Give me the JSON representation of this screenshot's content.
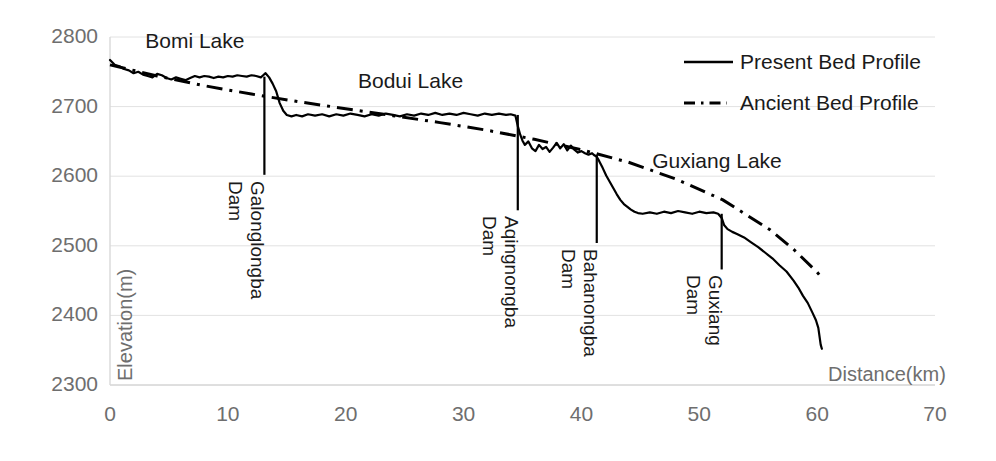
{
  "chart_data": {
    "type": "line",
    "title": "",
    "xlabel": "Distance(km)",
    "ylabel": "Elevation(m)",
    "xlim": [
      0,
      70
    ],
    "ylim": [
      2300,
      2800
    ],
    "xticks": [
      "0",
      "10",
      "20",
      "30",
      "40",
      "50",
      "60",
      "70"
    ],
    "xtick_values": [
      0,
      10,
      20,
      30,
      40,
      50,
      60,
      70
    ],
    "yticks": [
      "2300",
      "2400",
      "2500",
      "2600",
      "2700",
      "2800"
    ],
    "ytick_values": [
      2300,
      2400,
      2500,
      2600,
      2700,
      2800
    ],
    "grid": "horizontal-light",
    "legend_position": "top-right",
    "series": [
      {
        "name": "Present Bed Profile",
        "style": "solid",
        "color": "#000000",
        "x": [
          0.0,
          0.4,
          0.8,
          1.2,
          1.6,
          2.0,
          2.4,
          2.8,
          3.2,
          3.6,
          4.0,
          4.4,
          4.8,
          5.2,
          5.6,
          6.0,
          6.4,
          6.8,
          7.2,
          7.6,
          8.0,
          8.4,
          8.8,
          9.2,
          9.6,
          10.0,
          10.4,
          10.8,
          11.2,
          11.6,
          12.0,
          12.4,
          12.8,
          13.0,
          13.2,
          13.5,
          13.8,
          14.1,
          14.4,
          14.7,
          15.0,
          15.4,
          15.8,
          16.3,
          16.8,
          17.4,
          18.0,
          18.6,
          19.2,
          19.8,
          20.4,
          21.0,
          21.6,
          22.2,
          22.8,
          23.4,
          24.0,
          24.6,
          25.2,
          25.8,
          26.4,
          27.0,
          27.6,
          28.2,
          28.8,
          29.4,
          30.0,
          30.6,
          31.2,
          31.8,
          32.4,
          33.0,
          33.6,
          34.0,
          34.4,
          34.6,
          34.8,
          35.0,
          35.2,
          35.5,
          35.8,
          36.1,
          36.4,
          36.7,
          37.0,
          37.3,
          37.6,
          37.9,
          38.2,
          38.5,
          38.8,
          39.1,
          39.4,
          39.7,
          40.0,
          40.3,
          40.6,
          40.9,
          41.1,
          41.3,
          41.5,
          41.8,
          42.1,
          42.4,
          42.7,
          43.0,
          43.3,
          43.6,
          43.9,
          44.2,
          44.5,
          44.8,
          45.2,
          45.8,
          46.4,
          47.0,
          47.6,
          48.2,
          48.8,
          49.4,
          50.0,
          50.6,
          51.2,
          51.6,
          51.9,
          52.1,
          52.4,
          52.8,
          53.2,
          53.8,
          54.4,
          55.0,
          55.6,
          56.2,
          56.8,
          57.4,
          58.0,
          58.4,
          58.8,
          59.2,
          59.6,
          59.9,
          60.1,
          60.3,
          60.4
        ],
        "y": [
          2767,
          2760,
          2758,
          2754,
          2752,
          2748,
          2750,
          2746,
          2744,
          2742,
          2747,
          2745,
          2741,
          2739,
          2742,
          2740,
          2738,
          2741,
          2744,
          2742,
          2744,
          2743,
          2741,
          2743,
          2742,
          2744,
          2743,
          2745,
          2744,
          2743,
          2745,
          2744,
          2742,
          2745,
          2748,
          2742,
          2733,
          2722,
          2705,
          2694,
          2688,
          2686,
          2688,
          2686,
          2689,
          2687,
          2689,
          2686,
          2689,
          2687,
          2690,
          2688,
          2686,
          2689,
          2687,
          2690,
          2688,
          2686,
          2689,
          2687,
          2690,
          2688,
          2691,
          2688,
          2690,
          2688,
          2691,
          2689,
          2687,
          2690,
          2688,
          2690,
          2688,
          2689,
          2687,
          2672,
          2660,
          2651,
          2645,
          2650,
          2640,
          2636,
          2645,
          2639,
          2642,
          2635,
          2641,
          2648,
          2640,
          2646,
          2637,
          2644,
          2638,
          2634,
          2636,
          2633,
          2631,
          2633,
          2630,
          2628,
          2622,
          2612,
          2601,
          2592,
          2583,
          2574,
          2566,
          2560,
          2556,
          2552,
          2549,
          2547,
          2546,
          2548,
          2546,
          2549,
          2547,
          2550,
          2548,
          2546,
          2549,
          2547,
          2548,
          2546,
          2540,
          2530,
          2524,
          2520,
          2517,
          2512,
          2505,
          2498,
          2490,
          2482,
          2472,
          2463,
          2450,
          2440,
          2428,
          2418,
          2404,
          2393,
          2382,
          2358,
          2352
        ]
      },
      {
        "name": "Ancient Bed Profile",
        "style": "dash-dot",
        "color": "#000000",
        "x": [
          0,
          4,
          8,
          12,
          16,
          20,
          24,
          28,
          32,
          36,
          40,
          44,
          48,
          52,
          56,
          58,
          60,
          60.5
        ],
        "y": [
          2760,
          2744,
          2730,
          2718,
          2707,
          2697,
          2687,
          2677,
          2666,
          2653,
          2638,
          2620,
          2596,
          2566,
          2523,
          2495,
          2462,
          2452
        ]
      }
    ],
    "annotations": {
      "lakes": [
        {
          "label": "Bomi Lake",
          "x_km": 7.2,
          "y_m": 2791
        },
        {
          "label": "Bodui Lake",
          "x_km": 25.5,
          "y_m": 2734
        },
        {
          "label": "Guxiang Lake",
          "x_km": 51.5,
          "y_m": 2619
        }
      ],
      "dams": [
        {
          "name": "Galonglongba",
          "label_dam": "Dam",
          "x_km": 13.1,
          "top_m": 2743,
          "bottom_m": 2602
        },
        {
          "name": "Aqingnongba",
          "label_dam": "Dam",
          "x_km": 34.6,
          "top_m": 2688,
          "bottom_m": 2551
        },
        {
          "name": "Bahanongba",
          "label_dam": "Dam",
          "x_km": 41.3,
          "top_m": 2631,
          "bottom_m": 2504
        },
        {
          "name": "Guxiang",
          "label_dam": "Dam",
          "x_km": 51.9,
          "top_m": 2546,
          "bottom_m": 2466
        }
      ]
    }
  },
  "legend": {
    "items": [
      {
        "label": "Present Bed Profile",
        "style": "solid"
      },
      {
        "label": "Ancient Bed Profile",
        "style": "dash-dot"
      }
    ]
  }
}
